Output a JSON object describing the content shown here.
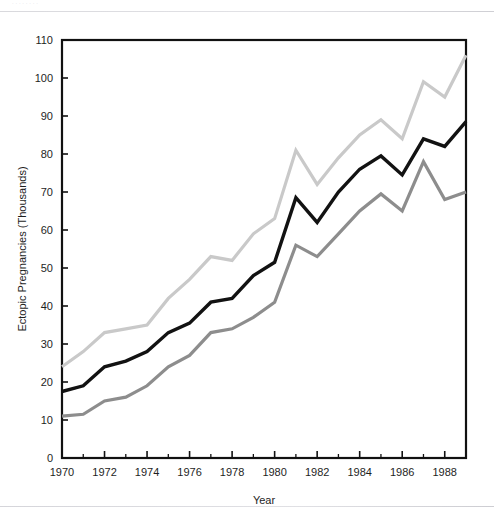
{
  "header": {
    "faint_text": "· · · · · · · ·"
  },
  "chart_data": {
    "type": "line",
    "title": "",
    "xlabel": "Year",
    "ylabel": "Ectopic Pregnancies (Thousands)",
    "xlim": [
      1970,
      1989
    ],
    "ylim": [
      0,
      110
    ],
    "grid": false,
    "legend": "none",
    "y_ticks": [
      0,
      10,
      20,
      30,
      40,
      50,
      60,
      70,
      80,
      90,
      100,
      110
    ],
    "y_tick_labels": [
      "0",
      "10",
      "20",
      "30",
      "40",
      "50",
      "60",
      "70",
      "80",
      "90",
      "100",
      "110"
    ],
    "x_ticks": [
      1970,
      1972,
      1974,
      1976,
      1978,
      1980,
      1982,
      1984,
      1986,
      1988
    ],
    "x_tick_labels": [
      "1970",
      "1972",
      "1974",
      "1976",
      "1978",
      "1980",
      "1982",
      "1984",
      "1986",
      "1988"
    ],
    "x_minor_ticks": [
      1971,
      1973,
      1975,
      1977,
      1979,
      1981,
      1983,
      1985,
      1987,
      1989
    ],
    "x": [
      1970,
      1971,
      1972,
      1973,
      1974,
      1975,
      1976,
      1977,
      1978,
      1979,
      1980,
      1981,
      1982,
      1983,
      1984,
      1985,
      1986,
      1987,
      1988,
      1989
    ],
    "series": [
      {
        "name": "upper",
        "color": "#c9c9c9",
        "width": 3.2,
        "values": [
          24,
          28,
          33,
          34,
          35,
          42,
          47,
          53,
          52,
          59,
          63,
          81,
          72,
          79,
          85,
          89,
          84,
          99,
          95,
          106
        ]
      },
      {
        "name": "middle",
        "color": "#121212",
        "width": 3.4,
        "values": [
          17.5,
          19,
          24,
          25.5,
          28,
          33,
          35.5,
          41,
          42,
          48,
          51.5,
          68.5,
          62,
          70,
          76,
          79.5,
          74.5,
          84,
          82,
          88.5
        ]
      },
      {
        "name": "lower",
        "color": "#8d8d8d",
        "width": 3.2,
        "values": [
          11,
          11.5,
          15,
          16,
          19,
          24,
          27,
          33,
          34,
          37,
          41,
          56,
          53,
          59,
          65,
          69.5,
          65,
          78,
          68,
          70
        ]
      }
    ]
  }
}
